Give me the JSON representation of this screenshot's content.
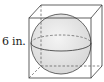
{
  "figure": {
    "dimension_label": "6 in.",
    "colors": {
      "stroke": "#3a3a3a",
      "sphere_fill": "#e6e6e6",
      "background": "#ffffff"
    }
  }
}
